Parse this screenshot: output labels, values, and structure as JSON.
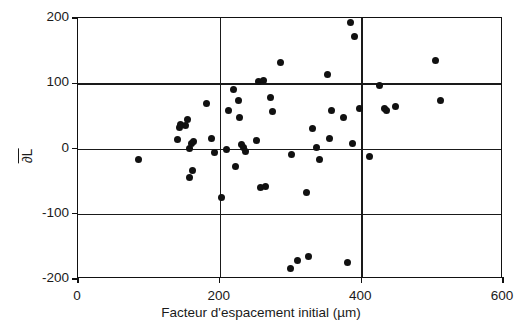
{
  "chart_data": {
    "type": "scatter",
    "title": "",
    "xlabel": "Facteur d'espacement initial (µm)",
    "ylabel": "∂L",
    "ylabel_has_overbar": true,
    "xlim": [
      0,
      600
    ],
    "ylim": [
      -200,
      200
    ],
    "xticks": [
      0,
      200,
      400,
      600
    ],
    "yticks": [
      -200,
      -100,
      0,
      100,
      200
    ],
    "xtick_labels": [
      "0",
      "200",
      "400",
      "600"
    ],
    "ytick_labels": [
      "-200",
      "-100",
      "0",
      "100",
      "200"
    ],
    "grid": true,
    "grid_axes": "both",
    "legend": false,
    "marker": "filled-circle",
    "marker_color": "#111111",
    "marker_size_px": 7,
    "n_points": 64,
    "points": [
      [
        85,
        -17
      ],
      [
        141,
        14
      ],
      [
        143,
        32
      ],
      [
        144,
        37
      ],
      [
        152,
        35
      ],
      [
        155,
        45
      ],
      [
        157,
        0
      ],
      [
        158,
        -44
      ],
      [
        160,
        8
      ],
      [
        161,
        -33
      ],
      [
        163,
        11
      ],
      [
        181,
        69
      ],
      [
        189,
        15
      ],
      [
        192,
        -6
      ],
      [
        203,
        -75
      ],
      [
        210,
        -1
      ],
      [
        212,
        58
      ],
      [
        219,
        91
      ],
      [
        222,
        -28
      ],
      [
        226,
        74
      ],
      [
        228,
        48
      ],
      [
        231,
        6
      ],
      [
        234,
        2
      ],
      [
        236,
        -5
      ],
      [
        252,
        12
      ],
      [
        255,
        103
      ],
      [
        258,
        -60
      ],
      [
        262,
        104
      ],
      [
        265,
        -58
      ],
      [
        272,
        78
      ],
      [
        274,
        57
      ],
      [
        286,
        132
      ],
      [
        300,
        -184
      ],
      [
        302,
        -9
      ],
      [
        310,
        -172
      ],
      [
        322,
        -68
      ],
      [
        325,
        -165
      ],
      [
        331,
        30
      ],
      [
        337,
        1
      ],
      [
        341,
        -17
      ],
      [
        352,
        114
      ],
      [
        355,
        16
      ],
      [
        358,
        59
      ],
      [
        375,
        48
      ],
      [
        380,
        -174
      ],
      [
        385,
        193
      ],
      [
        387,
        7
      ],
      [
        390,
        172
      ],
      [
        397,
        62
      ],
      [
        412,
        -12
      ],
      [
        425,
        96
      ],
      [
        432,
        61
      ],
      [
        436,
        59
      ],
      [
        448,
        64
      ],
      [
        505,
        135
      ],
      [
        512,
        74
      ]
    ]
  },
  "axes": {
    "x": {
      "label": "Facteur d'espacement initial (µm)",
      "ticks": [
        {
          "value": 0,
          "label": "0"
        },
        {
          "value": 200,
          "label": "200"
        },
        {
          "value": 400,
          "label": "400"
        },
        {
          "value": 600,
          "label": "600"
        }
      ]
    },
    "y": {
      "label": "∂L",
      "ticks": [
        {
          "value": 200,
          "label": "200"
        },
        {
          "value": 100,
          "label": "100"
        },
        {
          "value": 0,
          "label": "0"
        },
        {
          "value": -100,
          "label": "-100"
        },
        {
          "value": -200,
          "label": "-200"
        }
      ]
    }
  },
  "colors": {
    "marker": "#111111",
    "axis": "#111111",
    "grid": "#1a1a1a",
    "background": "#ffffff"
  }
}
